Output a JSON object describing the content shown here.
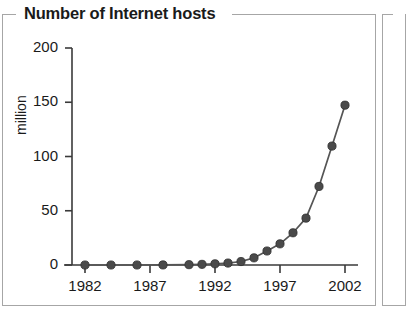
{
  "panel": {
    "title": "Number of Internet hosts"
  },
  "chart_data": {
    "type": "line",
    "title": "Number of Internet hosts",
    "xlabel": "",
    "ylabel": "million",
    "xlim": [
      1981,
      2003
    ],
    "ylim": [
      0,
      200
    ],
    "grid": false,
    "legend": null,
    "xticks": [
      "1982",
      "1987",
      "1992",
      "1997",
      "2002"
    ],
    "xtick_values": [
      1982,
      1987,
      1992,
      1997,
      2002
    ],
    "yticks": [
      "0",
      "50",
      "100",
      "150",
      "200"
    ],
    "ytick_values": [
      0,
      50,
      100,
      150,
      200
    ],
    "marker": "circle",
    "marker_color": "#4a4a4a",
    "line_color": "#555555",
    "x": [
      1982,
      1984,
      1986,
      1988,
      1990,
      1991,
      1992,
      1993,
      1994,
      1995,
      1996,
      1997,
      1998,
      1999,
      2000,
      2001,
      2002
    ],
    "values": [
      0.0002,
      0.001,
      0.005,
      0.06,
      0.3,
      0.6,
      1.1,
      1.8,
      3.2,
      6.6,
      12.9,
      19.5,
      29.7,
      43.2,
      72.4,
      109.6,
      147.3
    ],
    "series": [
      {
        "name": "Internet hosts",
        "values": [
          0.0002,
          0.001,
          0.005,
          0.06,
          0.3,
          0.6,
          1.1,
          1.8,
          3.2,
          6.6,
          12.9,
          19.5,
          29.7,
          43.2,
          72.4,
          109.6,
          147.3
        ]
      }
    ],
    "units": "million"
  }
}
